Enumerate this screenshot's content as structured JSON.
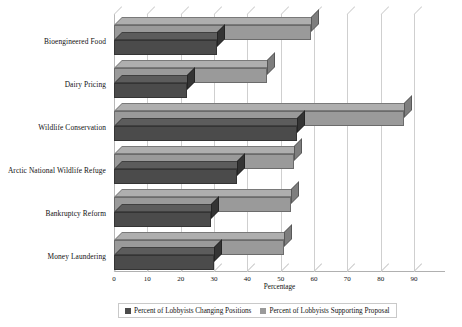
{
  "chart_data": {
    "type": "bar",
    "orientation": "horizontal",
    "title": "",
    "xlabel": "Percentage",
    "ylabel": "",
    "xlim": [
      0,
      90
    ],
    "xticks": [
      0,
      10,
      20,
      30,
      40,
      50,
      60,
      70,
      80,
      90
    ],
    "grid": true,
    "legend_position": "bottom",
    "style": "3d-bar",
    "categories": [
      "Bioengineered Food",
      "Dairy Pricing",
      "Wildlife Conservation",
      "Arctic National Wildlife Refuge",
      "Bankruptcy Reform",
      "Money Laundering"
    ],
    "series": [
      {
        "name": "Percent of Lobbyists Changing Positions",
        "color": "#4b4b4b",
        "values": [
          31,
          22,
          55,
          37,
          29,
          30
        ]
      },
      {
        "name": "Percent of Lobbyists Supporting Proposal",
        "color": "#9a9a9a",
        "values": [
          59,
          46,
          87,
          54,
          53,
          51
        ]
      }
    ]
  },
  "axis": {
    "x_label": "Percentage",
    "tick_labels": [
      "0",
      "10",
      "20",
      "30",
      "40",
      "50",
      "60",
      "70",
      "80",
      "90"
    ]
  },
  "legend": {
    "items": [
      {
        "label": "Percent of Lobbyists Changing Positions",
        "color": "#4b4b4b"
      },
      {
        "label": "Percent of Lobbyists Supporting Proposal",
        "color": "#9a9a9a"
      }
    ]
  }
}
